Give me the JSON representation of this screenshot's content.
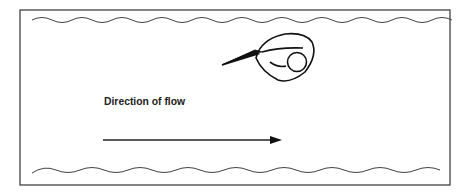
{
  "diagram": {
    "label": "Direction of flow",
    "elements": {
      "frame": "rectangular border",
      "top_boundary": "wavy line (water surface)",
      "bottom_boundary": "wavy line (channel bed)",
      "object": "curled organism with pointed beak facing upstream",
      "arrow": "flow direction arrow pointing right"
    },
    "colors": {
      "stroke": "#222222",
      "background": "#ffffff"
    }
  }
}
